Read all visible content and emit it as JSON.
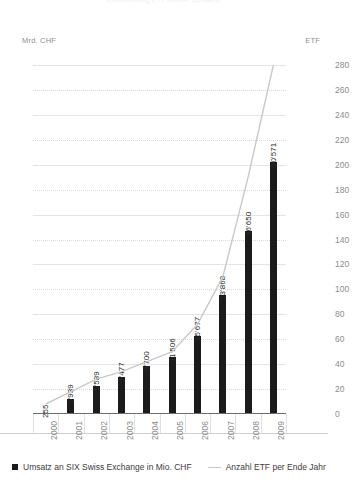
{
  "header": {
    "cropped_title": "Entwicklung ETF-Markt Schweiz",
    "left_axis_unit": "Mrd. CHF",
    "right_axis_unit": "ETF"
  },
  "legend": {
    "bars_label": "Umsatz an SIX Swiss Exchange in Mio. CHF",
    "line_label": "Anzahl ETF per Ende Jahr"
  },
  "colors": {
    "bar": "#1b1b1b",
    "line": "#c9c9c9",
    "grid": "#d8d8d8",
    "tick_text": "#8d8d8d",
    "label_text": "#2a2a2a"
  },
  "chart_data": {
    "type": "bar",
    "title": "Entwicklung ETF-Markt Schweiz",
    "xlabel": "",
    "ylabel": "Mrd. CHF",
    "y2label": "ETF",
    "ylim": [
      0,
      70
    ],
    "y2lim": [
      0,
      280
    ],
    "grid": true,
    "legend_position": "bottom-left",
    "categories": [
      "2000",
      "2001",
      "2002",
      "2003",
      "2004",
      "2005",
      "2006",
      "2007",
      "2008",
      "2009"
    ],
    "yticks": [
      0,
      5,
      10,
      15,
      20,
      25,
      30,
      35,
      40,
      45,
      50,
      55,
      60,
      65,
      70
    ],
    "y2ticks": [
      0,
      20,
      40,
      60,
      80,
      100,
      120,
      140,
      160,
      180,
      200,
      220,
      240,
      260,
      280
    ],
    "series": [
      {
        "name": "Umsatz an SIX Swiss Exchange in Mio. CHF",
        "type": "bar",
        "axis": "left",
        "unit": "Mio. CHF",
        "values": [
          255,
          2939,
          5589,
          7477,
          9700,
          11506,
          15677,
          23868,
          36650,
          50571
        ],
        "data_labels": [
          "255",
          "2'939",
          "5'589",
          "7'477",
          "9'700",
          "11'506",
          "15'677",
          "23'868",
          "36'650",
          "50'571"
        ]
      },
      {
        "name": "Anzahl ETF per Ende Jahr",
        "type": "line",
        "axis": "right",
        "unit": "ETF",
        "values": [
          8,
          18,
          28,
          34,
          42,
          50,
          72,
          110,
          190,
          280
        ]
      }
    ]
  }
}
